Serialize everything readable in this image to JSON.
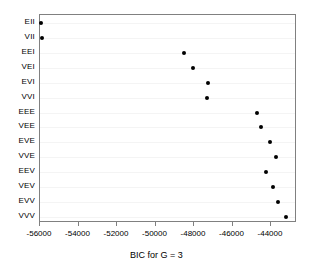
{
  "chart_data": {
    "type": "scatter",
    "title": "",
    "xlabel": "BIC for G = 3",
    "ylabel": "",
    "xlim": [
      -56500,
      -43000
    ],
    "ylim_categories_order": "top-to-bottom",
    "grid": true,
    "grid_orientation": "horizontal",
    "legend": "none",
    "point_color": "#000000",
    "point_shape": "filled-circle",
    "xticks": [
      -56000,
      -54000,
      -52000,
      -50000,
      -48000,
      -46000,
      -44000
    ],
    "xtick_labels": [
      "-56000",
      "-54000",
      "-52000",
      "-50000",
      "-48000",
      "-46000",
      "-44000"
    ],
    "categories": [
      "EII",
      "VII",
      "EEI",
      "VEI",
      "EVI",
      "VVI",
      "EEE",
      "VEE",
      "EVE",
      "VVE",
      "EEV",
      "VEV",
      "EVV",
      "VVV"
    ],
    "values": [
      -55950,
      -55900,
      -48500,
      -48060,
      -47290,
      -47320,
      -44730,
      -44530,
      -44040,
      -43750,
      -44270,
      -43920,
      -43660,
      -43230
    ],
    "points": [
      {
        "label": "EII",
        "value": -55950
      },
      {
        "label": "VII",
        "value": -55900
      },
      {
        "label": "EEI",
        "value": -48500
      },
      {
        "label": "VEI",
        "value": -48060
      },
      {
        "label": "EVI",
        "value": -47290
      },
      {
        "label": "VVI",
        "value": -47320
      },
      {
        "label": "EEE",
        "value": -44730
      },
      {
        "label": "VEE",
        "value": -44530
      },
      {
        "label": "EVE",
        "value": -44040
      },
      {
        "label": "VVE",
        "value": -43750
      },
      {
        "label": "EEV",
        "value": -44270
      },
      {
        "label": "VEV",
        "value": -43920
      },
      {
        "label": "EVV",
        "value": -43660
      },
      {
        "label": "VVV",
        "value": -43230
      }
    ]
  },
  "axis": {
    "x_title": "BIC for G = 3"
  }
}
